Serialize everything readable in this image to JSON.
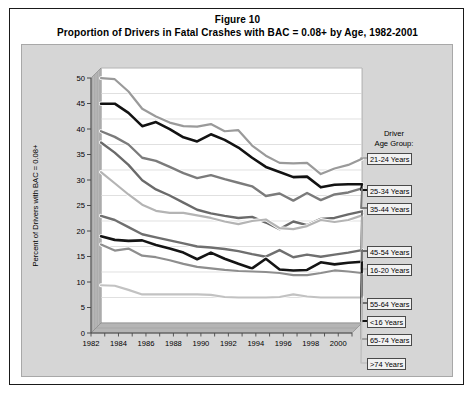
{
  "figure": {
    "title_line1": "Figure 10",
    "title_line2": "Proportion of Drivers in Fatal Crashes with BAC = 0.08+ by Age, 1982-2001"
  },
  "legend": {
    "header_line1": "Driver",
    "header_line2": "Age Group:",
    "items": [
      {
        "label": "21-24 Years",
        "key": "21-24"
      },
      {
        "label": "25-34 Years",
        "key": "25-34"
      },
      {
        "label": "35-44 Years",
        "key": "35-44"
      },
      {
        "label": "45-54 Years",
        "key": "45-54"
      },
      {
        "label": "16-20 Years",
        "key": "16-20"
      },
      {
        "label": "55-64 Years",
        "key": "55-64"
      },
      {
        "label": "<16 Years",
        "key": "<16"
      },
      {
        "label": "65-74 Years",
        "key": "65-74"
      },
      {
        "label": ">74 Years",
        "key": ">74"
      }
    ]
  },
  "chart_data": {
    "type": "line",
    "title": "Proportion of Drivers in Fatal Crashes with BAC = 0.08+ by Age, 1982-2001",
    "subtitle": "Figure 10",
    "xlabel": "",
    "ylabel": "Percent of Drivers with BAC = 0.08+",
    "ylim": [
      0,
      50
    ],
    "ytick_step": 5,
    "yticks": [
      0,
      5,
      10,
      15,
      20,
      25,
      30,
      35,
      40,
      45,
      50
    ],
    "xlim": [
      1982,
      2001
    ],
    "xticks": [
      1982,
      1984,
      1986,
      1988,
      1990,
      1992,
      1994,
      1996,
      1998,
      2000
    ],
    "x": [
      1982,
      1983,
      1984,
      1985,
      1986,
      1987,
      1988,
      1989,
      1990,
      1991,
      1992,
      1993,
      1994,
      1995,
      1996,
      1997,
      1998,
      1999,
      2000,
      2001
    ],
    "grid": true,
    "grid_axis": "y",
    "legend_position": "right",
    "series": [
      {
        "name": "21-24 Years",
        "color": "#9a9a9a",
        "width": 2.2,
        "values": [
          48.0,
          47.8,
          45.4,
          42.0,
          40.5,
          39.3,
          38.6,
          38.5,
          39.0,
          37.6,
          37.8,
          34.8,
          32.8,
          31.4,
          31.3,
          31.4,
          29.2,
          30.3,
          31.0,
          32.2
        ]
      },
      {
        "name": "25-34 Years",
        "color": "#121212",
        "width": 2.6,
        "values": [
          43.0,
          43.0,
          41.2,
          38.6,
          39.4,
          38.0,
          36.4,
          35.6,
          37.0,
          35.9,
          34.4,
          32.4,
          30.6,
          29.6,
          28.6,
          28.7,
          26.6,
          27.1,
          27.2,
          27.2
        ]
      },
      {
        "name": "35-44 Years",
        "color": "#7b7b7b",
        "width": 2.4,
        "values": [
          37.6,
          36.5,
          35.0,
          32.4,
          31.8,
          30.6,
          29.4,
          28.4,
          29.0,
          28.2,
          27.5,
          26.8,
          24.9,
          25.4,
          24.0,
          25.5,
          24.1,
          25.2,
          25.6,
          26.4
        ]
      },
      {
        "name": "45-54 Years",
        "color": "#6a6a6a",
        "width": 2.4,
        "values": [
          35.4,
          33.4,
          31.0,
          28.0,
          26.2,
          25.0,
          23.6,
          22.2,
          21.5,
          21.0,
          20.6,
          20.8,
          19.7,
          18.4,
          19.9,
          19.2,
          20.4,
          20.6,
          21.3,
          21.9
        ]
      },
      {
        "name": "16-20 Years",
        "color": "#b4b4b4",
        "width": 2.2,
        "values": [
          29.6,
          27.4,
          25.2,
          23.2,
          22.0,
          21.6,
          21.6,
          21.1,
          20.6,
          19.9,
          19.4,
          20.0,
          20.3,
          18.6,
          18.4,
          19.0,
          20.2,
          19.8,
          20.2,
          21.1
        ]
      },
      {
        "name": "55-64 Years",
        "color": "#6f6f6f",
        "width": 2.4,
        "values": [
          21.0,
          20.2,
          18.8,
          17.4,
          16.8,
          16.2,
          15.6,
          15.0,
          14.8,
          14.5,
          14.1,
          13.5,
          13.0,
          14.3,
          12.9,
          13.4,
          13.0,
          13.4,
          13.8,
          14.3
        ]
      },
      {
        "name": "<16 Years",
        "color": "#141414",
        "width": 2.6,
        "values": [
          17.0,
          16.3,
          16.1,
          16.2,
          15.3,
          14.6,
          13.8,
          12.5,
          13.8,
          12.6,
          11.6,
          10.7,
          12.6,
          10.5,
          10.3,
          10.4,
          11.9,
          11.5,
          11.8,
          12.0
        ]
      },
      {
        "name": "65-74 Years",
        "color": "#8e8e8e",
        "width": 2.2,
        "values": [
          15.4,
          14.2,
          14.6,
          13.2,
          12.9,
          12.3,
          11.6,
          11.0,
          10.7,
          10.4,
          10.2,
          10.1,
          10.0,
          9.8,
          9.4,
          9.4,
          9.8,
          10.3,
          10.1,
          9.8
        ]
      },
      {
        "name": ">74 Years",
        "color": "#c2c2c2",
        "width": 2.2,
        "values": [
          7.4,
          7.3,
          6.5,
          5.6,
          5.6,
          5.6,
          5.6,
          5.6,
          5.5,
          5.1,
          5.0,
          5.0,
          5.0,
          5.1,
          5.6,
          5.2,
          5.0,
          5.0,
          5.0,
          5.0
        ]
      }
    ]
  }
}
